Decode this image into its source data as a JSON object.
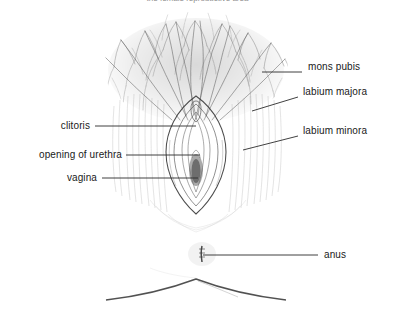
{
  "figure": {
    "title_partial": "the female reproductive area",
    "title_visible": false,
    "style": "pen-and-ink line drawing, photocopied",
    "background_color": "#ffffff",
    "ink_color": "#3a3a3a",
    "leader_line_color": "#2b2b2b",
    "width": 395,
    "height": 320
  },
  "labels": [
    {
      "id": "mons-pubis",
      "text": "mons pubis",
      "side": "right",
      "text_x": 308,
      "text_y": 67,
      "leader": {
        "x1": 302,
        "y1": 72,
        "x2": 262,
        "y2": 72,
        "kind": "straight"
      }
    },
    {
      "id": "labium-majora",
      "text": "labium majora",
      "side": "right",
      "text_x": 303,
      "text_y": 92,
      "leader": {
        "x1": 298,
        "y1": 97,
        "x2": 252,
        "y2": 111,
        "kind": "diagonal"
      }
    },
    {
      "id": "labium-minora",
      "text": "labium minora",
      "side": "right",
      "text_x": 303,
      "text_y": 131,
      "leader": {
        "x1": 298,
        "y1": 136,
        "x2": 243,
        "y2": 150,
        "kind": "diagonal"
      }
    },
    {
      "id": "clitoris",
      "text": "clitoris",
      "side": "left",
      "text_x": 55,
      "text_y": 120,
      "leader": {
        "x1": 95,
        "y1": 126,
        "x2": 196,
        "y2": 126,
        "kind": "straight"
      }
    },
    {
      "id": "opening-of-urethra",
      "text": "opening of urethra",
      "side": "left",
      "text_x": 8,
      "text_y": 149,
      "leader": {
        "x1": 126,
        "y1": 155,
        "x2": 200,
        "y2": 155,
        "kind": "straight"
      }
    },
    {
      "id": "vagina",
      "text": "vagina",
      "side": "left",
      "text_x": 62,
      "text_y": 172,
      "leader": {
        "x1": 102,
        "y1": 178,
        "x2": 198,
        "y2": 178,
        "kind": "straight"
      }
    },
    {
      "id": "anus",
      "text": "anus",
      "side": "right",
      "text_x": 324,
      "text_y": 250,
      "leader": {
        "x1": 318,
        "y1": 255,
        "x2": 203,
        "y2": 255,
        "kind": "straight"
      }
    }
  ],
  "structures": [
    {
      "id": "pubic-hair",
      "name": "pubic hair region",
      "description": "dense crosshatched pen strokes"
    },
    {
      "id": "vulva",
      "name": "vulva",
      "description": "concentric oval outlines"
    },
    {
      "id": "perineum",
      "name": "perineum shading",
      "description": "vertical hatching"
    },
    {
      "id": "anus-mark",
      "name": "anus marking",
      "description": "small dark vertical cluster"
    },
    {
      "id": "buttock-curve",
      "name": "buttock / thigh contour",
      "description": "broad low arc"
    }
  ]
}
